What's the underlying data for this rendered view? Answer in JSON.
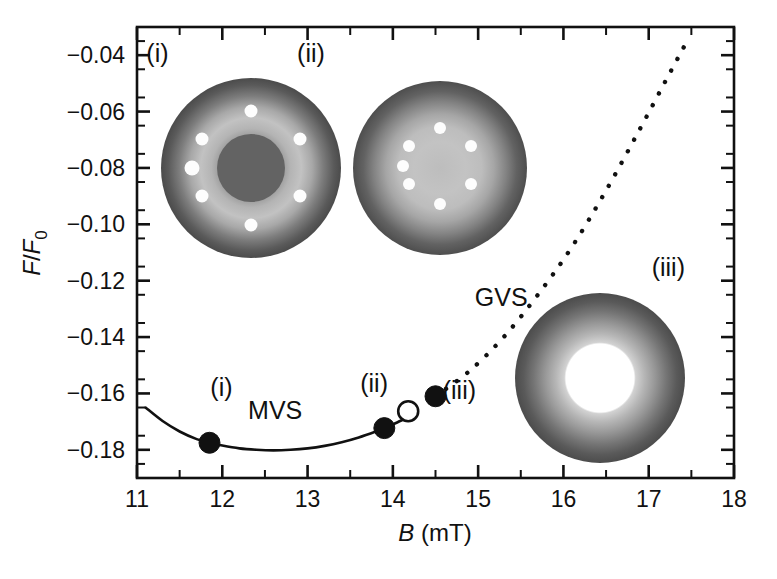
{
  "chart_data": {
    "type": "line",
    "title": "",
    "xlabel": "B (mT)",
    "xlabel_symbol": "B",
    "xlabel_unit": "(mT)",
    "ylabel": "F/F0",
    "ylabel_numerator": "F",
    "ylabel_denominator": "F",
    "ylabel_subscript": "0",
    "xlim": [
      11,
      18
    ],
    "ylim": [
      -0.19,
      -0.03
    ],
    "xticks": [
      11,
      12,
      13,
      14,
      15,
      16,
      17,
      18
    ],
    "xticklabels": [
      "11",
      "12",
      "13",
      "14",
      "15",
      "16",
      "17",
      "18"
    ],
    "xminor_step": 0.5,
    "yticks": [
      -0.04,
      -0.06,
      -0.08,
      -0.1,
      -0.12,
      -0.14,
      -0.16,
      -0.18
    ],
    "yticklabels": [
      "-0.04",
      "-0.06",
      "-0.08",
      "-0.10",
      "-0.12",
      "-0.14",
      "-0.16",
      "-0.18"
    ],
    "yminor_step": 0.01,
    "grid": false,
    "legend_position": "none",
    "series": [
      {
        "name": "MVS",
        "style": "solid",
        "x": [
          11.1,
          11.3,
          11.5,
          11.7,
          11.85,
          12.0,
          12.2,
          12.4,
          12.6,
          12.8,
          13.0,
          13.2,
          13.4,
          13.6,
          13.8,
          13.9,
          14.05,
          14.2
        ],
        "y": [
          -0.165,
          -0.1698,
          -0.1735,
          -0.1762,
          -0.1775,
          -0.1785,
          -0.1795,
          -0.18,
          -0.1802,
          -0.18,
          -0.1795,
          -0.1786,
          -0.1773,
          -0.1756,
          -0.1735,
          -0.1723,
          -0.1703,
          -0.168
        ]
      },
      {
        "name": "GVS",
        "style": "dotted",
        "x": [
          14.5,
          14.9,
          15.3,
          15.7,
          16.1,
          16.5,
          16.9,
          17.2,
          17.45
        ],
        "y": [
          -0.161,
          -0.152,
          -0.14,
          -0.125,
          -0.108,
          -0.088,
          -0.066,
          -0.049,
          -0.035
        ]
      }
    ],
    "markers": [
      {
        "label": "(i)",
        "x": 11.85,
        "y": -0.1775,
        "style": "filled"
      },
      {
        "label": "(ii)",
        "x": 13.9,
        "y": -0.1723,
        "style": "filled"
      },
      {
        "label": "",
        "x": 14.18,
        "y": -0.1663,
        "style": "open"
      },
      {
        "label": "(iii)",
        "x": 14.5,
        "y": -0.161,
        "style": "filled"
      }
    ],
    "annotations": [
      {
        "text": "(i)",
        "x": 11.24,
        "y": -0.0425,
        "name": "inset-i-top-label"
      },
      {
        "text": "(ii)",
        "x": 13.04,
        "y": -0.0425,
        "name": "inset-ii-top-label"
      },
      {
        "text": "(iii)",
        "x": 17.23,
        "y": -0.1185,
        "name": "inset-iii-right-label"
      },
      {
        "text": "(i)",
        "x": 11.99,
        "y": -0.161,
        "name": "curve-point-i-label"
      },
      {
        "text": "MVS",
        "x": 12.62,
        "y": -0.169,
        "name": "mvs-branch-label"
      },
      {
        "text": "(ii)",
        "x": 13.78,
        "y": -0.1595,
        "name": "curve-point-ii-label"
      },
      {
        "text": "(iii)",
        "x": 14.78,
        "y": -0.162,
        "name": "curve-point-iii-label"
      },
      {
        "text": "GVS",
        "x": 15.27,
        "y": -0.129,
        "name": "gvs-branch-label"
      }
    ],
    "insets": [
      {
        "name": "inset-i",
        "type": "vortex-cluster-disk",
        "center_x": 12.33,
        "center_y": -0.08,
        "radius_px": 90,
        "dots": 7,
        "has_dark_core": true,
        "description": "multi-vortex state disk with ring of 7 vortices and dark core"
      },
      {
        "name": "inset-ii",
        "type": "vortex-cluster-disk",
        "center_x": 13.85,
        "center_y": -0.08,
        "radius_px": 85,
        "dots": 7,
        "has_dark_core": false,
        "description": "multi-vortex state disk with ring of 7 vortices, bright core"
      },
      {
        "name": "inset-iii",
        "type": "annulus",
        "center_x": 16.77,
        "center_y": -0.15,
        "radius_px": 85,
        "hole_ratio": 0.42,
        "description": "giant vortex state annulus with white hole"
      }
    ],
    "colors": {
      "foreground": "#111111",
      "background": "#ffffff",
      "inset_dark": "#4a4a4a",
      "inset_mid": "#8e8e8e",
      "inset_bright": "#d8d8d8",
      "inset_dot": "#fdfdfd"
    }
  }
}
